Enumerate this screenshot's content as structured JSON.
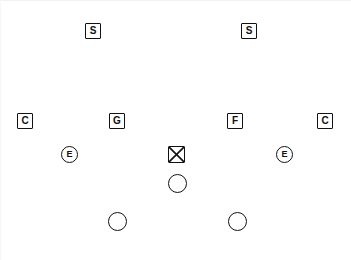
{
  "diagram": {
    "width": 351,
    "height": 260,
    "background_color": "#ffffff",
    "ink_color": "#111111",
    "markers": [
      {
        "id": "safety-left",
        "label": "S",
        "shape": "square",
        "x": 84,
        "y": 22,
        "row": "defensive-backs-deep"
      },
      {
        "id": "safety-right",
        "label": "S",
        "shape": "square",
        "x": 240,
        "y": 22,
        "row": "defensive-backs-deep"
      },
      {
        "id": "corner-left",
        "label": "C",
        "shape": "square",
        "x": 16,
        "y": 112,
        "row": "line"
      },
      {
        "id": "guard-left",
        "label": "G",
        "shape": "square",
        "x": 108,
        "y": 112,
        "row": "line"
      },
      {
        "id": "flanker-right",
        "label": "F",
        "shape": "square",
        "x": 226,
        "y": 112,
        "row": "line"
      },
      {
        "id": "corner-right",
        "label": "C",
        "shape": "square",
        "x": 316,
        "y": 112,
        "row": "line"
      },
      {
        "id": "end-left",
        "label": "E",
        "shape": "circle-letter",
        "x": 60,
        "y": 145,
        "row": "ends"
      },
      {
        "id": "center-ball",
        "label": "",
        "shape": "square-x",
        "x": 167,
        "y": 145,
        "row": "ends"
      },
      {
        "id": "end-right",
        "label": "E",
        "shape": "circle-letter",
        "x": 275,
        "y": 145,
        "row": "ends"
      },
      {
        "id": "quarterback",
        "label": "",
        "shape": "circle-open",
        "x": 167,
        "y": 173,
        "row": "backfield-near"
      },
      {
        "id": "halfback-left",
        "label": "",
        "shape": "circle-open",
        "x": 107,
        "y": 211,
        "row": "backfield-deep"
      },
      {
        "id": "halfback-right",
        "label": "",
        "shape": "circle-open",
        "x": 227,
        "y": 211,
        "row": "backfield-deep"
      }
    ]
  }
}
